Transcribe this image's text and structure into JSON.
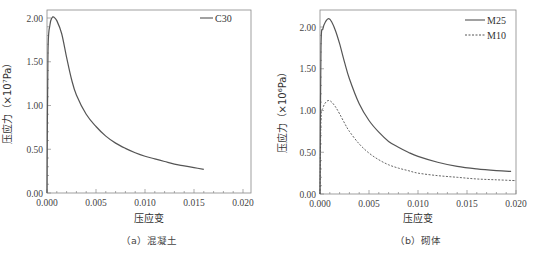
{
  "chart_data": [
    {
      "type": "line",
      "panel": "a",
      "caption": "（a）混凝土",
      "xlabel": "压应变",
      "ylabel": "压应力（×10⁷Pa）",
      "xlim": [
        0.0,
        0.02
      ],
      "ylim": [
        0.0,
        2.1
      ],
      "xticks": [
        "0.000",
        "0.005",
        "0.010",
        "0.015",
        "0.020"
      ],
      "yticks": [
        "0.00",
        "0.50",
        "1.00",
        "1.50",
        "2.00"
      ],
      "grid": false,
      "legend_position": "upper right",
      "series": [
        {
          "name": "C30",
          "style": "solid",
          "x": [
            0.0,
            0.0001,
            0.0003,
            0.0005,
            0.0007,
            0.001,
            0.0015,
            0.002,
            0.0025,
            0.003,
            0.004,
            0.005,
            0.006,
            0.007,
            0.008,
            0.009,
            0.01,
            0.011,
            0.012,
            0.013,
            0.014,
            0.015,
            0.016
          ],
          "values": [
            0.0,
            1.6,
            1.92,
            2.0,
            2.01,
            1.97,
            1.82,
            1.55,
            1.3,
            1.12,
            0.9,
            0.76,
            0.65,
            0.57,
            0.51,
            0.46,
            0.42,
            0.39,
            0.36,
            0.33,
            0.31,
            0.29,
            0.27
          ]
        }
      ]
    },
    {
      "type": "line",
      "panel": "b",
      "caption": "（b）砌体",
      "xlabel": "压应变",
      "ylabel": "压应力（×10⁶Pa）",
      "xlim": [
        0.0,
        0.02
      ],
      "ylim": [
        0.0,
        2.2
      ],
      "xticks": [
        "0.000",
        "0.005",
        "0.010",
        "0.015",
        "0.020"
      ],
      "yticks": [
        "0.00",
        "0.50",
        "1.00",
        "1.50",
        "2.00"
      ],
      "grid": false,
      "legend_position": "upper right",
      "series": [
        {
          "name": "M25",
          "style": "solid",
          "x": [
            0.0,
            0.0001,
            0.0003,
            0.0006,
            0.0009,
            0.0012,
            0.0016,
            0.002,
            0.0025,
            0.003,
            0.004,
            0.005,
            0.006,
            0.007,
            0.008,
            0.009,
            0.01,
            0.012,
            0.014,
            0.016,
            0.018,
            0.0195
          ],
          "values": [
            0.0,
            1.75,
            1.98,
            2.07,
            2.1,
            2.06,
            1.95,
            1.8,
            1.58,
            1.38,
            1.08,
            0.88,
            0.74,
            0.63,
            0.56,
            0.5,
            0.45,
            0.38,
            0.33,
            0.3,
            0.28,
            0.27
          ]
        },
        {
          "name": "M10",
          "style": "dashed",
          "x": [
            0.0,
            0.0001,
            0.0003,
            0.0006,
            0.0009,
            0.0012,
            0.0016,
            0.002,
            0.0025,
            0.003,
            0.004,
            0.005,
            0.006,
            0.007,
            0.008,
            0.009,
            0.01,
            0.012,
            0.014,
            0.016,
            0.018,
            0.02
          ],
          "values": [
            0.0,
            0.88,
            1.03,
            1.1,
            1.12,
            1.1,
            1.04,
            0.96,
            0.85,
            0.75,
            0.6,
            0.49,
            0.41,
            0.35,
            0.31,
            0.28,
            0.25,
            0.22,
            0.2,
            0.18,
            0.17,
            0.16
          ]
        }
      ]
    }
  ],
  "panels": {
    "a": {
      "caption": "（a）混凝土",
      "xlabel": "压应变",
      "ylabel": "压应力（×10⁷Pa）",
      "legend": [
        "C30"
      ]
    },
    "b": {
      "caption": "（b）砌体",
      "xlabel": "压应变",
      "ylabel": "压应力（×10⁶Pa）",
      "legend": [
        "M25",
        "M10"
      ]
    }
  },
  "colors": {
    "line": "#555555",
    "axis": "#888888",
    "text": "#333333"
  }
}
